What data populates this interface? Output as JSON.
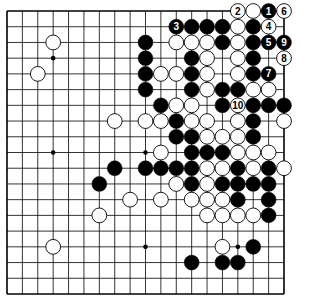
{
  "diagram": {
    "type": "go-board",
    "size": 19,
    "colors": {
      "background": "#ffffff",
      "line": "#000000",
      "black_stone": "#000000",
      "white_stone": "#ffffff"
    },
    "star_points": [
      [
        3,
        3
      ],
      [
        3,
        9
      ],
      [
        3,
        15
      ],
      [
        9,
        3
      ],
      [
        9,
        9
      ],
      [
        9,
        15
      ],
      [
        15,
        3
      ],
      [
        15,
        9
      ],
      [
        15,
        15
      ]
    ],
    "black_stones": [
      [
        0,
        17,
        "1"
      ],
      [
        1,
        11,
        "3"
      ],
      [
        1,
        12
      ],
      [
        1,
        13
      ],
      [
        1,
        14
      ],
      [
        1,
        16
      ],
      [
        2,
        9
      ],
      [
        2,
        14
      ],
      [
        2,
        16
      ],
      [
        2,
        17,
        "5"
      ],
      [
        2,
        18,
        "9"
      ],
      [
        3,
        9
      ],
      [
        3,
        12
      ],
      [
        3,
        16
      ],
      [
        4,
        9
      ],
      [
        4,
        12
      ],
      [
        4,
        16
      ],
      [
        4,
        17,
        "7"
      ],
      [
        5,
        9
      ],
      [
        5,
        12
      ],
      [
        5,
        14
      ],
      [
        5,
        15
      ],
      [
        6,
        10
      ],
      [
        6,
        14
      ],
      [
        6,
        16
      ],
      [
        6,
        17
      ],
      [
        6,
        18
      ],
      [
        7,
        11
      ],
      [
        7,
        16
      ],
      [
        8,
        11
      ],
      [
        8,
        12
      ],
      [
        8,
        16
      ],
      [
        9,
        12
      ],
      [
        9,
        13
      ],
      [
        9,
        14
      ],
      [
        10,
        7
      ],
      [
        10,
        9
      ],
      [
        10,
        10
      ],
      [
        10,
        11
      ],
      [
        10,
        12
      ],
      [
        10,
        15
      ],
      [
        10,
        17
      ],
      [
        11,
        6
      ],
      [
        11,
        12
      ],
      [
        11,
        14
      ],
      [
        11,
        15
      ],
      [
        11,
        16
      ],
      [
        11,
        17
      ],
      [
        12,
        15
      ],
      [
        12,
        17
      ],
      [
        13,
        17
      ],
      [
        15,
        16
      ],
      [
        16,
        12
      ],
      [
        16,
        14
      ],
      [
        16,
        15
      ]
    ],
    "white_stones": [
      [
        0,
        15,
        "2"
      ],
      [
        0,
        16
      ],
      [
        0,
        18,
        "6"
      ],
      [
        1,
        15
      ],
      [
        1,
        17,
        "4"
      ],
      [
        2,
        3
      ],
      [
        2,
        11
      ],
      [
        2,
        12
      ],
      [
        2,
        13
      ],
      [
        2,
        15
      ],
      [
        3,
        13
      ],
      [
        3,
        15
      ],
      [
        3,
        18,
        "8"
      ],
      [
        4,
        2
      ],
      [
        4,
        10
      ],
      [
        4,
        11
      ],
      [
        4,
        13
      ],
      [
        4,
        15
      ],
      [
        5,
        13
      ],
      [
        5,
        16
      ],
      [
        5,
        17
      ],
      [
        6,
        11
      ],
      [
        6,
        12
      ],
      [
        6,
        15,
        "10"
      ],
      [
        7,
        7
      ],
      [
        7,
        9
      ],
      [
        7,
        10
      ],
      [
        7,
        12
      ],
      [
        7,
        13
      ],
      [
        7,
        15
      ],
      [
        7,
        18
      ],
      [
        8,
        13
      ],
      [
        8,
        14
      ],
      [
        8,
        15
      ],
      [
        9,
        10
      ],
      [
        9,
        15
      ],
      [
        9,
        16
      ],
      [
        9,
        17
      ],
      [
        10,
        13
      ],
      [
        10,
        14
      ],
      [
        10,
        16
      ],
      [
        10,
        18
      ],
      [
        11,
        11
      ],
      [
        11,
        13
      ],
      [
        12,
        8
      ],
      [
        12,
        10
      ],
      [
        12,
        12
      ],
      [
        12,
        13
      ],
      [
        12,
        14
      ],
      [
        13,
        6
      ],
      [
        13,
        13
      ],
      [
        13,
        14
      ],
      [
        13,
        15
      ],
      [
        13,
        16
      ],
      [
        15,
        3
      ],
      [
        15,
        14
      ]
    ]
  }
}
